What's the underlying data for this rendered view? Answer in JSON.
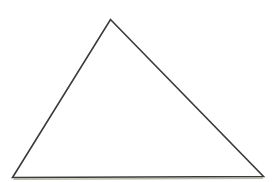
{
  "document": {
    "title": "Triangle Figure",
    "kind": "line-drawing",
    "background_color": "#ffffff",
    "width": 275,
    "height": 182
  },
  "figure": {
    "name": "triangle",
    "shape_type": "triangle",
    "classification": "scalene",
    "fill": "none",
    "stroke_color": "#3a3a38",
    "stroke_width": 1.6,
    "scan_shadow_color": "#b9b9ad",
    "scan_shadow_width": 1.4,
    "vertices": [
      {
        "label": "apex",
        "x": 110.5,
        "y": 19.5
      },
      {
        "label": "bottom-right",
        "x": 263.5,
        "y": 176.5
      },
      {
        "label": "bottom-left",
        "x": 12.5,
        "y": 177.5
      }
    ],
    "path": "M 110.5 19.5 L 263.5 176.5 L 12.5 177.5 Z",
    "base_shadow_path": "M 13.5 179.3 L 263.0 178.3",
    "edges": [
      {
        "name": "left-edge",
        "from": "apex",
        "to": "bottom-left"
      },
      {
        "name": "right-edge",
        "from": "apex",
        "to": "bottom-right"
      },
      {
        "name": "base-edge",
        "from": "bottom-left",
        "to": "bottom-right"
      }
    ]
  }
}
